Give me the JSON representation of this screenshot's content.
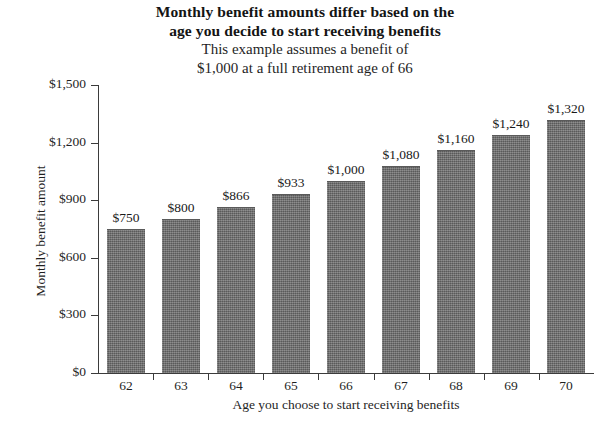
{
  "chart_data": {
    "type": "bar",
    "title": "Monthly benefit amounts differ based on the age you decide to start receiving benefits",
    "title_lines": [
      "Monthly benefit amounts differ based on the",
      "age you decide to start receiving benefits"
    ],
    "subtitle_lines": [
      "This example assumes a benefit of",
      "$1,000 at a full retirement age of 66"
    ],
    "xlabel": "Age you choose to start receiving benefits",
    "ylabel": "Monthly benefit amount",
    "categories": [
      "62",
      "63",
      "64",
      "65",
      "66",
      "67",
      "68",
      "69",
      "70"
    ],
    "values": [
      750,
      800,
      866,
      933,
      1000,
      1080,
      1160,
      1240,
      1320
    ],
    "value_labels": [
      "$750",
      "$800",
      "$866",
      "$933",
      "$1,000",
      "$1,080",
      "$1,160",
      "$1,240",
      "$1,320"
    ],
    "ylim": [
      0,
      1500
    ],
    "ytick_values": [
      0,
      300,
      600,
      900,
      1200,
      1500
    ],
    "ytick_labels": [
      "$0",
      "$300",
      "$600",
      "$900",
      "$1,200",
      "$1,500"
    ],
    "grid": false,
    "legend": null,
    "bar_color": "#6e6e6e",
    "axis_color": "#3b3b3b",
    "background_color": "#ffffff"
  }
}
